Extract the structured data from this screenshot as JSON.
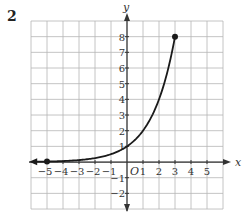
{
  "problem_number": "2",
  "chart_data": {
    "type": "line",
    "title": "",
    "function": "y = 2^x",
    "xlabel": "x",
    "ylabel": "y",
    "origin_label": "O",
    "xlim": [
      -6,
      6
    ],
    "ylim": [
      -3,
      9
    ],
    "grid": true,
    "x_ticks": [
      "-5",
      "-4",
      "-3",
      "-2",
      "-1",
      "1",
      "2",
      "3",
      "4",
      "5"
    ],
    "y_ticks": [
      "-2",
      "-1",
      "1",
      "2",
      "3",
      "4",
      "5",
      "6",
      "7",
      "8"
    ],
    "series": [
      {
        "name": "curve",
        "x": [
          -5.8,
          -5,
          -4,
          -3,
          -2,
          -1,
          0,
          1,
          2,
          3
        ],
        "y": [
          0.018,
          0.03125,
          0.0625,
          0.125,
          0.25,
          0.5,
          1,
          2,
          4,
          8
        ],
        "left_end": "arrow",
        "right_end": "closed-dot"
      }
    ],
    "marked_points": [
      {
        "x": -5,
        "y": 0.03125,
        "style": "closed-dot"
      },
      {
        "x": 3,
        "y": 8,
        "style": "closed-dot"
      }
    ],
    "colors": {
      "grid": "#b5b5b5",
      "axis": "#333333",
      "curve": "#1a1a1a"
    }
  }
}
